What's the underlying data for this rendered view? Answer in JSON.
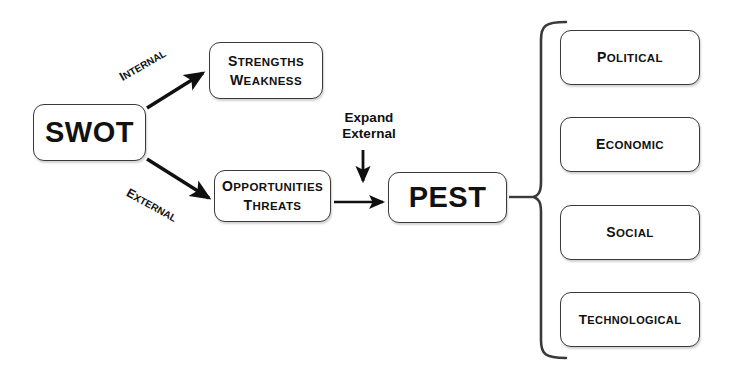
{
  "diagram": {
    "stroke_color": "#3a3a3a",
    "text_color": "#111111",
    "background": "#ffffff"
  },
  "nodes": {
    "swot": {
      "label": "SWOT"
    },
    "internal_factors": {
      "line1": "Strengths",
      "line2": "Weakness"
    },
    "external_factors": {
      "line1": "Opportunities",
      "line2": "Threats"
    },
    "pest": {
      "label": "PEST"
    },
    "pest_components": [
      {
        "label": "Political"
      },
      {
        "label": "Economic"
      },
      {
        "label": "Social"
      },
      {
        "label": "Technological"
      }
    ]
  },
  "edges": {
    "internal_label": "Internal",
    "external_label": "External",
    "expand_line1": "Expand",
    "expand_line2": "External"
  }
}
